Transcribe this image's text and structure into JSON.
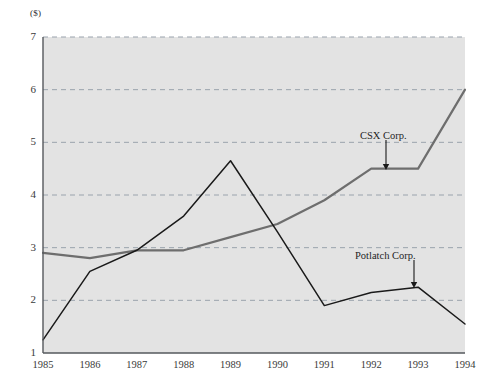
{
  "chart_data": {
    "type": "line",
    "title": "",
    "subtitle": "",
    "xlabel": "",
    "ylabel": "($)",
    "unit_label": "($)",
    "categories": [
      "1985",
      "1986",
      "1987",
      "1988",
      "1989",
      "1990",
      "1991",
      "1992",
      "1993",
      "1994"
    ],
    "x": [
      1985,
      1986,
      1987,
      1988,
      1989,
      1990,
      1991,
      1992,
      1993,
      1994
    ],
    "xlim": [
      1985,
      1994
    ],
    "ylim": [
      1,
      7
    ],
    "y_ticks": [
      1,
      2,
      3,
      4,
      5,
      6,
      7
    ],
    "y_tick_labels": [
      "1",
      "2",
      "3",
      "4",
      "5",
      "6",
      "7"
    ],
    "grid": true,
    "grid_style": "dashed-horizontal",
    "legend": "none",
    "legend_position": "inline-annotations",
    "plot_background": "#e3e3e3",
    "grid_color": "#9aa3ad",
    "axis_color": "#55585c",
    "series": [
      {
        "name": "CSX Corp.",
        "color": "#6e6e6e",
        "width": 2.2,
        "values": [
          2.9,
          2.8,
          2.95,
          2.95,
          3.2,
          3.45,
          3.9,
          4.5,
          4.5,
          6.0
        ]
      },
      {
        "name": "Potlatch Corp.",
        "color": "#1a1a1a",
        "width": 1.5,
        "values": [
          1.25,
          2.55,
          2.95,
          3.6,
          4.65,
          3.3,
          1.9,
          2.15,
          2.25,
          1.55
        ]
      }
    ],
    "annotations": [
      {
        "text": "CSX Corp.",
        "series": "CSX Corp.",
        "points_to_x": 1992,
        "points_to_y": 4.5,
        "label_x": 360,
        "label_y": 131,
        "arrow_x": 386,
        "arrow_y_start": 140,
        "arrow_y_end": 170
      },
      {
        "text": "Potlatch Corp.",
        "series": "Potlatch Corp.",
        "points_to_x": 1993,
        "points_to_y": 2.25,
        "label_x": 355,
        "label_y": 251,
        "arrow_x": 414,
        "arrow_y_start": 260,
        "arrow_y_end": 288
      }
    ]
  }
}
